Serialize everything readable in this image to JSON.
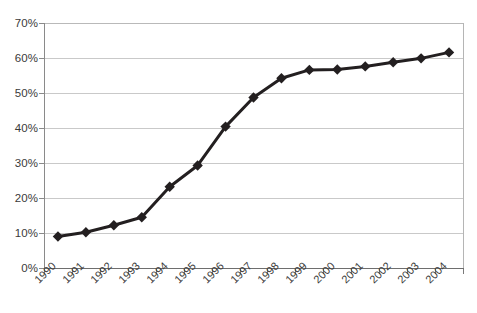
{
  "chart_data": {
    "type": "line",
    "title": "",
    "subtitle": "",
    "xlabel": "",
    "ylabel": "",
    "categories": [
      "1990",
      "1991",
      "1992",
      "1993",
      "1994",
      "1995",
      "1996",
      "1997",
      "1998",
      "1999",
      "2000",
      "2001",
      "2002",
      "2003",
      "2004"
    ],
    "values": [
      9.0,
      10.2,
      12.2,
      14.5,
      23.2,
      29.3,
      40.4,
      48.7,
      54.2,
      56.6,
      56.7,
      57.6,
      58.8,
      59.9,
      61.6
    ],
    "series": [
      {
        "name": "",
        "values": [
          9.0,
          10.2,
          12.2,
          14.5,
          23.2,
          29.3,
          40.4,
          48.7,
          54.2,
          56.6,
          56.7,
          57.6,
          58.8,
          59.9,
          61.6
        ]
      }
    ],
    "ylim": [
      0,
      70
    ],
    "ytick_values": [
      0,
      10,
      20,
      30,
      40,
      50,
      60,
      70
    ],
    "ytick_labels": [
      "0%",
      "10%",
      "20%",
      "30%",
      "40%",
      "50%",
      "60%",
      "70%"
    ],
    "xtick_labels": [
      "1990",
      "1991",
      "1992",
      "1993",
      "1994",
      "1995",
      "1996",
      "1997",
      "1998",
      "1999",
      "2000",
      "2001",
      "2002",
      "2003",
      "2004"
    ],
    "grid": true,
    "grid_axis": "y",
    "legend": false,
    "legend_position": "none",
    "marker": "diamond",
    "marker_color": "#231f20",
    "line_color": "#231f20",
    "line_width": 3,
    "grid_color": "#c9c9c9",
    "axis_color": "#6e6e6e",
    "background_color": "#ffffff",
    "xlabel_rotation": -45,
    "annotations": []
  },
  "footer": {
    "caption": ""
  }
}
